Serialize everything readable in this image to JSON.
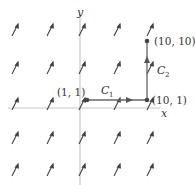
{
  "diagram": {
    "axes": {
      "x_label": "x",
      "y_label": "y"
    },
    "points": [
      {
        "label": "(1, 1)",
        "x": 87,
        "y": 100
      },
      {
        "label": "(10, 1)",
        "x": 147,
        "y": 100
      },
      {
        "label": "(10, 10)",
        "x": 147,
        "y": 41
      }
    ],
    "paths": [
      {
        "name": "C",
        "sub": "1",
        "from": "(1, 1)",
        "to": "(10, 1)"
      },
      {
        "name": "C",
        "sub": "2",
        "from": "(10, 1)",
        "to": "(10, 10)"
      }
    ],
    "vector_field": {
      "columns": [
        15,
        50,
        82,
        117,
        150
      ],
      "rows": [
        30,
        68,
        104,
        138,
        170
      ],
      "direction": "up-right"
    },
    "colors": {
      "axis": "#bbbbbb",
      "path": "#666666",
      "arrow": "#444444"
    }
  }
}
